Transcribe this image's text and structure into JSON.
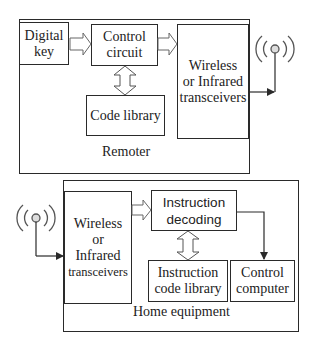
{
  "remoter": {
    "label": "Remoter",
    "blocks": {
      "digital_key": "Digital\nkey",
      "control_circuit": "Control\ncircuit",
      "code_library": "Code library",
      "transceivers": "Wireless\nor Infrared\ntransceivers"
    }
  },
  "home_equipment": {
    "label": "Home equipment",
    "blocks": {
      "transceivers_line1": "Wireless\nor\nInfrared",
      "transceivers_line2": "transceivers",
      "instruction_decoding": "Instruction\ndecoding",
      "instruction_code_library": "Instruction\ncode library",
      "control_computer": "Control\ncomputer"
    }
  },
  "icons": {
    "antenna_remoter": "antenna-icon",
    "antenna_home": "antenna-icon"
  },
  "colors": {
    "stroke": "#2a2a2a",
    "text": "#222222",
    "background": "#ffffff"
  }
}
